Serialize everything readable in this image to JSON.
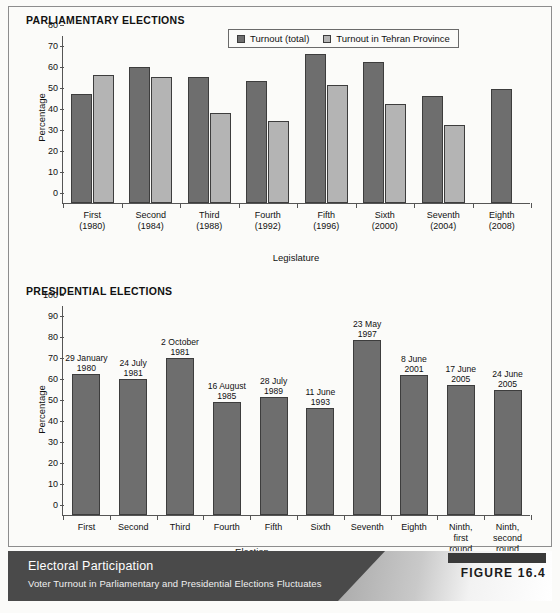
{
  "figure": {
    "badge_label": "FIGURE 16.4",
    "caption_title": "Electoral Participation",
    "caption_subtitle": "Voter Turnout in Parliamentary and Presidential Elections Fluctuates"
  },
  "sections": {
    "parliamentary_title": "PARLIAMENTARY ELECTIONS",
    "presidential_title": "PRESIDENTIAL ELECTIONS"
  },
  "legend": {
    "items": [
      {
        "label": "Turnout (total)",
        "color": "#6e6e6e"
      },
      {
        "label": "Turnout in Tehran Province",
        "color": "#b4b4b4"
      }
    ]
  },
  "chart_data": [
    {
      "type": "bar",
      "title": "PARLIAMENTARY ELECTIONS",
      "xlabel": "Legislature",
      "ylabel": "Percentage",
      "ylim": [
        0,
        80
      ],
      "yticks": [
        0,
        10,
        20,
        30,
        40,
        50,
        60,
        70,
        80
      ],
      "grid": false,
      "legend_position": "top-right",
      "categories": [
        "First\n(1980)",
        "Second\n(1984)",
        "Third\n(1988)",
        "Fourth\n(1992)",
        "Fifth\n(1996)",
        "Sixth\n(2000)",
        "Seventh\n(2004)",
        "Eighth\n(2008)"
      ],
      "category_lines": [
        [
          "First",
          "(1980)"
        ],
        [
          "Second",
          "(1984)"
        ],
        [
          "Third",
          "(1988)"
        ],
        [
          "Fourth",
          "(1992)"
        ],
        [
          "Fifth",
          "(1996)"
        ],
        [
          "Sixth",
          "(2000)"
        ],
        [
          "Seventh",
          "(2004)"
        ],
        [
          "Eighth",
          "(2008)"
        ]
      ],
      "series": [
        {
          "name": "Turnout (total)",
          "color": "#6e6e6e",
          "values": [
            52,
            65,
            60,
            58,
            71,
            67,
            51,
            54.5
          ]
        },
        {
          "name": "Turnout in Tehran Province",
          "color": "#b4b4b4",
          "values": [
            61,
            60,
            43,
            39,
            56,
            47,
            37,
            null
          ]
        }
      ]
    },
    {
      "type": "bar",
      "title": "PRESIDENTIAL ELECTIONS",
      "xlabel": "Election",
      "ylabel": "Percentage",
      "ylim": [
        0,
        100
      ],
      "yticks": [
        0,
        10,
        20,
        30,
        40,
        50,
        60,
        70,
        80,
        90,
        100
      ],
      "grid": false,
      "legend_position": "none",
      "categories": [
        "First",
        "Second",
        "Third",
        "Fourth",
        "Fifth",
        "Sixth",
        "Seventh",
        "Eighth",
        "Ninth, first round",
        "Ninth, second round"
      ],
      "category_lines": [
        [
          "First"
        ],
        [
          "Second"
        ],
        [
          "Third"
        ],
        [
          "Fourth"
        ],
        [
          "Fifth"
        ],
        [
          "Sixth"
        ],
        [
          "Seventh"
        ],
        [
          "Eighth"
        ],
        [
          "Ninth,",
          "first",
          "round"
        ],
        [
          "Ninth,",
          "second",
          "round"
        ]
      ],
      "series": [
        {
          "name": "Turnout",
          "color": "#6e6e6e",
          "values": [
            67,
            65,
            75,
            54,
            56,
            51,
            83.5,
            66.5,
            62,
            59.5
          ]
        }
      ],
      "bar_notes": [
        [
          "29 January",
          "1980"
        ],
        [
          "24 July",
          "1981"
        ],
        [
          "2 October",
          "1981"
        ],
        [
          "16 August",
          "1985"
        ],
        [
          "28 July",
          "1989"
        ],
        [
          "11 June",
          "1993"
        ],
        [
          "23 May",
          "1997"
        ],
        [
          "8 June",
          "2001"
        ],
        [
          "17 June",
          "2005"
        ],
        [
          "24 June",
          "2005"
        ]
      ],
      "last_bar_note": [
        "12 June",
        "2009"
      ],
      "values_with_notes": [
        67,
        65,
        75,
        54,
        56,
        51,
        83.5,
        66.5,
        62,
        59.5,
        84.5
      ]
    }
  ]
}
